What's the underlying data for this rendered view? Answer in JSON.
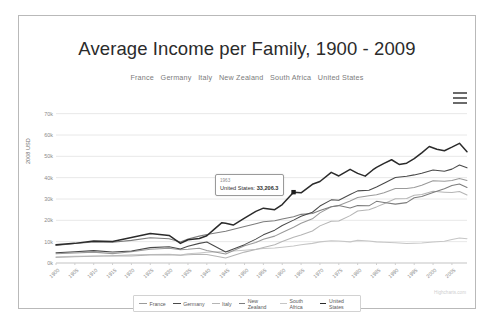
{
  "chart": {
    "title": "Average Income per Family, 1900 - 2009",
    "subtitle": "France   Germany   Italy   New Zealand   South Africa   United States",
    "credits": "Highcharts.com",
    "menu_icon": "hamburger-menu-icon"
  },
  "tooltip": {
    "visible": true,
    "header": "1963",
    "body_series": "United States:",
    "body_value": "33,206.3"
  },
  "legend": {
    "position": "bottom",
    "items": [
      {
        "label": "France",
        "color": "#9a9a9a"
      },
      {
        "label": "Germany",
        "color": "#4a4a4a"
      },
      {
        "label": "Italy",
        "color": "#b5b5b5"
      },
      {
        "label": "New Zealand",
        "color": "#7d7d7d"
      },
      {
        "label": "South Africa",
        "color": "#c6c6c6"
      },
      {
        "label": "United States",
        "color": "#2b2b2b"
      }
    ]
  },
  "chart_data": {
    "type": "line",
    "title": "Average Income per Family, 1900 - 2009",
    "subtitle": "France   Germany   Italy   New Zealand   South Africa   United States",
    "xlabel": "",
    "ylabel": "2008 USD",
    "ylim": [
      0,
      75000
    ],
    "yticks": [
      0,
      10000,
      20000,
      30000,
      40000,
      50000,
      60000,
      70000
    ],
    "ytick_labels": [
      "0k",
      "10k",
      "20k",
      "30k",
      "40k",
      "50k",
      "60k",
      "70k"
    ],
    "xlim": [
      1900,
      2009
    ],
    "xticks": [
      1900,
      1905,
      1910,
      1915,
      1920,
      1925,
      1930,
      1935,
      1940,
      1945,
      1950,
      1955,
      1960,
      1965,
      1970,
      1975,
      1980,
      1985,
      1990,
      1995,
      2000,
      2005
    ],
    "xtick_labels": [
      "1900",
      "1905",
      "1910",
      "1915",
      "1920",
      "1925",
      "1930",
      "1935",
      "1940",
      "1945",
      "1950",
      "1955",
      "1960",
      "1965",
      "1970",
      "1975",
      "1980",
      "1985",
      "1990",
      "1995",
      "2000",
      "2005"
    ],
    "grid": "horizontal",
    "legend_position": "bottom",
    "annotations": [
      {
        "x": 1963,
        "series": "United States",
        "value": 33206.3,
        "label": "1963 United States: 33,206.3"
      }
    ],
    "series": [
      {
        "name": "United States",
        "color": "#2b2b2b",
        "x": [
          1900,
          1905,
          1910,
          1915,
          1920,
          1925,
          1930,
          1933,
          1935,
          1938,
          1940,
          1942,
          1944,
          1945,
          1947,
          1950,
          1953,
          1955,
          1958,
          1960,
          1963,
          1965,
          1968,
          1970,
          1973,
          1975,
          1978,
          1980,
          1982,
          1984,
          1985,
          1987,
          1989,
          1991,
          1993,
          1995,
          1997,
          1999,
          2001,
          2003,
          2005,
          2007,
          2009
        ],
        "values": [
          8500,
          9200,
          10300,
          10100,
          12000,
          13800,
          12900,
          9200,
          10900,
          11500,
          12800,
          15900,
          18900,
          18600,
          17800,
          21000,
          24200,
          25700,
          25000,
          27400,
          33206,
          32900,
          36900,
          38200,
          42500,
          40800,
          43900,
          42000,
          40700,
          43600,
          44800,
          46700,
          48400,
          46200,
          46800,
          48900,
          51600,
          54600,
          53300,
          52600,
          54300,
          56100,
          52200
        ]
      },
      {
        "name": "Germany",
        "color": "#4a4a4a",
        "x": [
          1900,
          1905,
          1910,
          1915,
          1920,
          1925,
          1930,
          1933,
          1935,
          1938,
          1940,
          1945,
          1950,
          1953,
          1955,
          1958,
          1960,
          1963,
          1965,
          1968,
          1970,
          1973,
          1975,
          1978,
          1980,
          1983,
          1985,
          1987,
          1990,
          1993,
          1995,
          1997,
          2000,
          2003,
          2005,
          2007,
          2009
        ],
        "values": [
          4800,
          5300,
          5800,
          5200,
          5600,
          7200,
          7600,
          6600,
          7800,
          9200,
          9800,
          5200,
          8600,
          11200,
          13200,
          15400,
          17600,
          20100,
          21900,
          23800,
          26700,
          29600,
          29400,
          32100,
          33800,
          34100,
          35600,
          37400,
          40100,
          40700,
          41300,
          42100,
          43600,
          43000,
          44000,
          45900,
          44600
        ]
      },
      {
        "name": "New Zealand",
        "color": "#7d7d7d",
        "x": [
          1900,
          1905,
          1910,
          1915,
          1920,
          1925,
          1930,
          1933,
          1935,
          1938,
          1940,
          1945,
          1950,
          1953,
          1955,
          1958,
          1960,
          1963,
          1965,
          1968,
          1970,
          1973,
          1975,
          1978,
          1980,
          1983,
          1985,
          1987,
          1990,
          1993,
          1995,
          1997,
          2000,
          2003,
          2005,
          2007,
          2009
        ],
        "values": [
          8200,
          9100,
          9800,
          9700,
          10600,
          11800,
          11400,
          9800,
          11200,
          12600,
          13400,
          14900,
          17100,
          18400,
          19300,
          19800,
          20600,
          21700,
          22800,
          23200,
          24600,
          26400,
          26900,
          25800,
          26900,
          26800,
          28900,
          28400,
          27600,
          28300,
          30600,
          31200,
          33100,
          34800,
          36300,
          37000,
          35400
        ]
      },
      {
        "name": "France",
        "color": "#9a9a9a",
        "x": [
          1900,
          1905,
          1910,
          1915,
          1920,
          1925,
          1930,
          1933,
          1935,
          1938,
          1940,
          1945,
          1950,
          1953,
          1955,
          1958,
          1960,
          1963,
          1965,
          1968,
          1970,
          1973,
          1975,
          1978,
          1980,
          1983,
          1985,
          1987,
          1990,
          1993,
          1995,
          1997,
          2000,
          2003,
          2005,
          2007,
          2009
        ],
        "values": [
          4300,
          4700,
          5100,
          4400,
          5300,
          6400,
          6900,
          6200,
          6400,
          6900,
          5900,
          4200,
          8100,
          9600,
          11100,
          12600,
          14300,
          16800,
          18600,
          20700,
          23500,
          26400,
          27000,
          29100,
          30700,
          31500,
          32000,
          32900,
          34900,
          34900,
          35400,
          36400,
          38600,
          38300,
          38700,
          39600,
          38700
        ]
      },
      {
        "name": "Italy",
        "color": "#b5b5b5",
        "x": [
          1900,
          1905,
          1910,
          1915,
          1920,
          1925,
          1930,
          1933,
          1935,
          1938,
          1940,
          1945,
          1950,
          1953,
          1955,
          1958,
          1960,
          1963,
          1965,
          1968,
          1970,
          1973,
          1975,
          1978,
          1980,
          1983,
          1985,
          1987,
          1990,
          1993,
          1995,
          1997,
          2000,
          2003,
          2005,
          2007,
          2009
        ],
        "values": [
          2600,
          2900,
          3200,
          3400,
          3300,
          3800,
          3900,
          3600,
          3900,
          4100,
          4000,
          2300,
          5100,
          6300,
          7300,
          8600,
          10100,
          12100,
          13100,
          15000,
          17400,
          19600,
          19700,
          22200,
          24400,
          25000,
          26300,
          27800,
          30100,
          30200,
          31800,
          32100,
          33600,
          33200,
          33000,
          33500,
          31900
        ]
      },
      {
        "name": "South Africa",
        "color": "#c6c6c6",
        "x": [
          1900,
          1905,
          1910,
          1915,
          1920,
          1925,
          1930,
          1933,
          1935,
          1938,
          1940,
          1945,
          1950,
          1953,
          1955,
          1958,
          1960,
          1963,
          1965,
          1968,
          1970,
          1973,
          1975,
          1978,
          1980,
          1983,
          1985,
          1987,
          1990,
          1993,
          1995,
          1997,
          2000,
          2003,
          2005,
          2007,
          2009
        ],
        "values": [
          2900,
          3100,
          3300,
          3400,
          3800,
          4000,
          4100,
          3700,
          4300,
          4700,
          5000,
          5400,
          6000,
          6400,
          6800,
          7000,
          7400,
          8000,
          8600,
          9200,
          9900,
          10400,
          10300,
          9900,
          10600,
          10300,
          9900,
          9700,
          9500,
          9100,
          9300,
          9400,
          9800,
          10200,
          11000,
          11700,
          11400
        ]
      }
    ]
  }
}
